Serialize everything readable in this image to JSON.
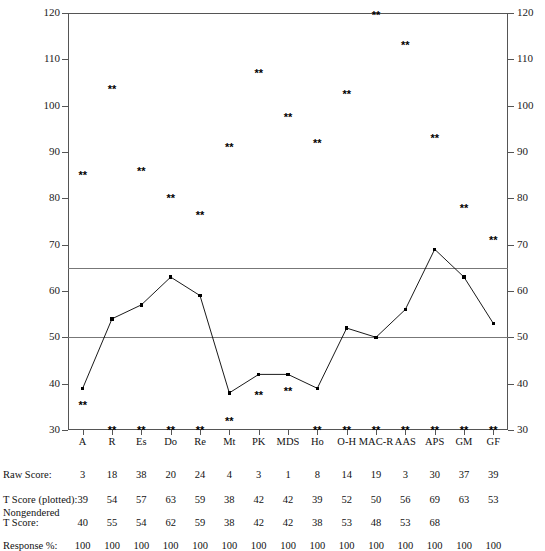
{
  "chart_data": {
    "type": "line",
    "title": "",
    "xlabel": "",
    "ylabel": "",
    "ylim": [
      30,
      120
    ],
    "yticks": [
      30,
      40,
      50,
      60,
      70,
      80,
      90,
      100,
      110,
      120
    ],
    "grid": false,
    "legend": "none",
    "reference_lines": [
      65,
      50
    ],
    "categories": [
      "A",
      "R",
      "Es",
      "Do",
      "Re",
      "Mt",
      "PK",
      "MDS",
      "Ho",
      "O-H",
      "MAC-R",
      "AAS",
      "APS",
      "GM",
      "GF"
    ],
    "series": [
      {
        "name": "T Score (plotted)",
        "values": [
          39,
          54,
          57,
          63,
          59,
          38,
          42,
          42,
          39,
          52,
          50,
          56,
          69,
          63,
          53
        ]
      },
      {
        "name": "Upper response marker",
        "marker": "**",
        "values": [
          85,
          103.5,
          86,
          80,
          76.5,
          91,
          107,
          97.5,
          92,
          102.5,
          119.5,
          113,
          93,
          78,
          71
        ]
      },
      {
        "name": "Lower response marker",
        "marker": "**",
        "values": [
          35.5,
          30,
          30,
          30,
          30,
          32,
          37.5,
          38.5,
          30,
          30,
          30,
          30,
          30,
          30,
          30
        ]
      }
    ]
  },
  "table": {
    "rows": [
      {
        "label": "Raw Score:",
        "values": [
          "3",
          "18",
          "38",
          "20",
          "24",
          "4",
          "3",
          "1",
          "8",
          "14",
          "19",
          "3",
          "30",
          "37",
          "39"
        ]
      },
      {
        "label": "T Score (plotted):",
        "values": [
          "39",
          "54",
          "57",
          "63",
          "59",
          "38",
          "42",
          "42",
          "39",
          "52",
          "50",
          "56",
          "69",
          "63",
          "53"
        ]
      },
      {
        "label": "Nongendered\nT Score:",
        "label_line1": "Nongendered",
        "label_line2": "T Score:",
        "values": [
          "40",
          "55",
          "54",
          "62",
          "59",
          "38",
          "42",
          "42",
          "38",
          "53",
          "48",
          "53",
          "68",
          "",
          ""
        ]
      },
      {
        "label": "Response %:",
        "values": [
          "100",
          "100",
          "100",
          "100",
          "100",
          "100",
          "100",
          "100",
          "100",
          "100",
          "100",
          "100",
          "100",
          "100",
          "100"
        ]
      }
    ]
  },
  "axis": {
    "left_ticks": [
      "120",
      "110",
      "100",
      "90",
      "80",
      "70",
      "60",
      "50",
      "40",
      "30"
    ],
    "right_ticks": [
      "120",
      "110",
      "100",
      "90",
      "80",
      "70",
      "60",
      "50",
      "40",
      "30"
    ]
  },
  "colors": {
    "line": "#000000",
    "marker": "#000000",
    "frame": "#555555",
    "refline": "#777777",
    "text": "#111111"
  }
}
